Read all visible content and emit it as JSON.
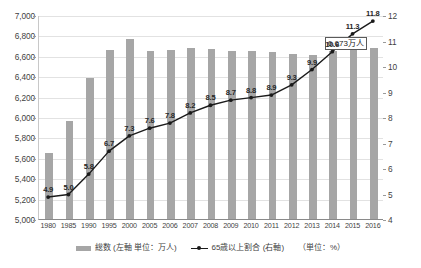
{
  "chart_data": {
    "type": "bar",
    "title": "",
    "xlabel": "",
    "ylabel": "",
    "grid": true,
    "legend_position": "bottom",
    "categories": [
      "1980",
      "1985",
      "1990",
      "1995",
      "2000",
      "2005",
      "2006",
      "2007",
      "2008",
      "2009",
      "2010",
      "2011",
      "2012",
      "2013",
      "2014",
      "2015",
      "2016"
    ],
    "left_axis": {
      "label": "総数 (左軸 単位：万人)",
      "ylim": [
        5000,
        7000
      ],
      "ticks": [
        "5,000",
        "5,200",
        "5,400",
        "5,600",
        "5,800",
        "6,000",
        "6,200",
        "6,400",
        "6,600",
        "6,800",
        "7,000"
      ],
      "tick_values": [
        5000,
        5200,
        5400,
        5600,
        5800,
        6000,
        6200,
        6400,
        6600,
        6800,
        7000
      ]
    },
    "right_axis": {
      "label": "65歳以上割合 (右軸)",
      "ylim": [
        4,
        12
      ],
      "ticks": [
        "4",
        "5",
        "6",
        "7",
        "8",
        "9",
        "10",
        "11",
        "12"
      ],
      "tick_values": [
        4,
        5,
        6,
        7,
        8,
        9,
        10,
        11,
        12
      ]
    },
    "series": [
      {
        "name": "総数 (左軸 単位：万人)",
        "type": "bar",
        "axis": "left",
        "color": "#a6a6a6",
        "values": [
          5650,
          5960,
          6380,
          6660,
          6760,
          6650,
          6660,
          6680,
          6670,
          6650,
          6650,
          6640,
          6620,
          6610,
          6650,
          6660,
          6673
        ]
      },
      {
        "name": "65歳以上割合 (右軸)",
        "type": "line",
        "axis": "right",
        "color": "#1a1a1a",
        "values": [
          4.9,
          5.0,
          5.8,
          6.7,
          7.3,
          7.6,
          7.8,
          8.2,
          8.5,
          8.7,
          8.8,
          8.9,
          9.3,
          9.9,
          10.6,
          11.3,
          11.8
        ],
        "data_labels": [
          "4.9",
          "5.0",
          "5.8",
          "6.7",
          "7.3",
          "7.6",
          "7.8",
          "8.2",
          "8.5",
          "8.7",
          "8.8",
          "8.9",
          "9.3",
          "9.9",
          "10.6",
          "11.3",
          "11.8"
        ]
      }
    ],
    "annotations": [
      {
        "name": "total-callout",
        "text": "6,673万人",
        "target_category": "2016"
      }
    ],
    "unit_note": "（単位：%）"
  },
  "legend": {
    "bar_label": "総数 (左軸 単位：万人)",
    "line_label": "65歳以上割合 (右軸)",
    "unit_label": "（単位：%）"
  }
}
